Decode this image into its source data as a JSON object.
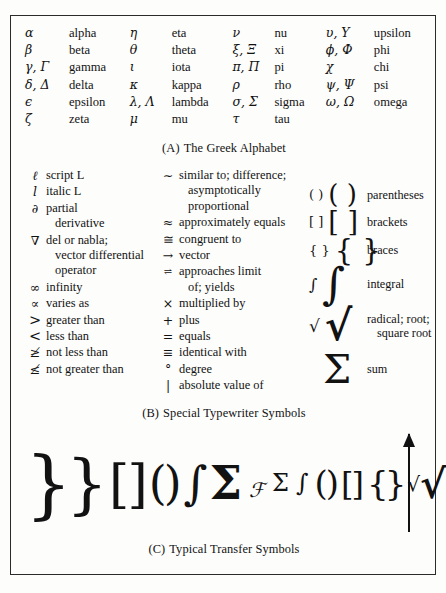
{
  "figure": {
    "panel_a": {
      "caption_tag": "(A)",
      "caption_text": "The Greek Alphabet",
      "columns": [
        [
          {
            "symbol": "α",
            "name": "alpha"
          },
          {
            "symbol": "β",
            "name": "beta"
          },
          {
            "symbol": "γ, Γ",
            "name": "gamma"
          },
          {
            "symbol": "δ, Δ",
            "name": "delta"
          },
          {
            "symbol": "ϵ",
            "name": "epsilon"
          },
          {
            "symbol": "ζ",
            "name": "zeta"
          }
        ],
        [
          {
            "symbol": "η",
            "name": "eta"
          },
          {
            "symbol": "θ",
            "name": "theta"
          },
          {
            "symbol": "ι",
            "name": "iota"
          },
          {
            "symbol": "κ",
            "name": "kappa"
          },
          {
            "symbol": "λ, Λ",
            "name": "lambda"
          },
          {
            "symbol": "μ",
            "name": "mu"
          }
        ],
        [
          {
            "symbol": "ν",
            "name": "nu"
          },
          {
            "symbol": "ξ, Ξ",
            "name": "xi"
          },
          {
            "symbol": "π, Π",
            "name": "pi"
          },
          {
            "symbol": "ρ",
            "name": "rho"
          },
          {
            "symbol": "σ, Σ",
            "name": "sigma"
          },
          {
            "symbol": "τ",
            "name": "tau"
          }
        ],
        [
          {
            "symbol": "υ, Υ",
            "name": "upsilon"
          },
          {
            "symbol": "ϕ, Φ",
            "name": "phi"
          },
          {
            "symbol": "χ",
            "name": "chi"
          },
          {
            "symbol": "ψ, Ψ",
            "name": "psi"
          },
          {
            "symbol": "ω, Ω",
            "name": "omega"
          }
        ]
      ]
    },
    "panel_b": {
      "caption_tag": "(B)",
      "caption_text": "Special Typewriter Symbols",
      "column1": [
        {
          "symbol": "ℓ",
          "text": "script L",
          "cont": ""
        },
        {
          "symbol": "l",
          "text": "italic L",
          "cont": ""
        },
        {
          "symbol": "∂",
          "text": "partial",
          "cont": "derivative"
        },
        {
          "symbol": "∇",
          "text": "del or nabla;",
          "cont": "vector differential",
          "cont2": "operator"
        },
        {
          "symbol": "∞",
          "text": "infinity",
          "cont": ""
        },
        {
          "symbol": "∝",
          "text": "varies as",
          "cont": ""
        },
        {
          "symbol": ">",
          "text": "greater than",
          "cont": ""
        },
        {
          "symbol": "<",
          "text": "less than",
          "cont": ""
        },
        {
          "symbol": "≱",
          "text": "not less than",
          "cont": ""
        },
        {
          "symbol": "≰",
          "text": "not greater than",
          "cont": ""
        }
      ],
      "column2": [
        {
          "symbol": "∼",
          "text": "similar to; difference;",
          "cont": "asymptotically",
          "cont2": "proportional"
        },
        {
          "symbol": "≈",
          "text": "approximately equals",
          "cont": ""
        },
        {
          "symbol": "≅",
          "text": "congruent to",
          "cont": ""
        },
        {
          "symbol": "→",
          "text": "vector",
          "cont": ""
        },
        {
          "symbol": "⇌",
          "text": "approaches limit",
          "cont": "of; yields"
        },
        {
          "symbol": "×",
          "text": "multiplied by",
          "cont": ""
        },
        {
          "symbol": "+",
          "text": "plus",
          "cont": ""
        },
        {
          "symbol": "=",
          "text": "equals",
          "cont": ""
        },
        {
          "symbol": "≡",
          "text": "identical with",
          "cont": ""
        },
        {
          "symbol": "°",
          "text": "degree",
          "cont": ""
        },
        {
          "symbol": "|",
          "text": "absolute value of",
          "cont": ""
        }
      ],
      "column3": [
        {
          "small": "( )",
          "large": "( )",
          "label": "parentheses",
          "label2": ""
        },
        {
          "small": "[ ]",
          "large": "[ ]",
          "label": "brackets",
          "label2": ""
        },
        {
          "small": "{ }",
          "large": "{ }",
          "label": "braces",
          "label2": ""
        },
        {
          "small": "∫",
          "large": "∫",
          "label": "integral",
          "label2": ""
        },
        {
          "small": "√",
          "large": "√",
          "label": "radical; root;",
          "label2": "square root"
        },
        {
          "small": "",
          "large": "Σ",
          "label": "sum",
          "label2": ""
        }
      ]
    },
    "panel_c": {
      "caption_tag": "(C)",
      "caption_text": "Typical Transfer Symbols",
      "glyphs": [
        {
          "char": "}",
          "size": 74,
          "style": "normal"
        },
        {
          "char": "}",
          "size": 66,
          "style": "normal"
        },
        {
          "char": "[",
          "size": 52,
          "style": "normal"
        },
        {
          "char": "]",
          "size": 52,
          "style": "normal"
        },
        {
          "char": "(",
          "size": 46,
          "style": "normal"
        },
        {
          "char": ")",
          "size": 46,
          "style": "normal"
        },
        {
          "char": "∫",
          "size": 46,
          "style": "normal"
        },
        {
          "char": "Σ",
          "size": 46,
          "style": "bold"
        },
        {
          "char": "ℱ",
          "size": 20,
          "style": "italic"
        },
        {
          "char": "Σ",
          "size": 24,
          "style": "normal"
        },
        {
          "char": "∫",
          "size": 24,
          "style": "normal"
        },
        {
          "char": "(",
          "size": 34,
          "style": "normal"
        },
        {
          "char": ")",
          "size": 34,
          "style": "normal"
        },
        {
          "char": "[",
          "size": 32,
          "style": "normal"
        },
        {
          "char": "]",
          "size": 32,
          "style": "normal"
        },
        {
          "char": "{",
          "size": 34,
          "style": "normal"
        },
        {
          "char": "}",
          "size": 34,
          "style": "normal"
        },
        {
          "char": "√",
          "size": 20,
          "style": "normal"
        },
        {
          "char": "√",
          "size": 40,
          "style": "bold"
        }
      ],
      "arrow": "vertical-up-arrow"
    }
  }
}
